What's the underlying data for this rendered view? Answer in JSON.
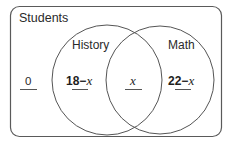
{
  "diagram": {
    "type": "venn",
    "universe_label": "Students",
    "sets": [
      {
        "name": "History",
        "label": "History"
      },
      {
        "name": "Math",
        "label": "Math"
      }
    ],
    "regions": {
      "outside": {
        "value": "0"
      },
      "history_only": {
        "number": "18",
        "op": "−",
        "var": "x"
      },
      "both": {
        "var": "x"
      },
      "math_only": {
        "number": "22",
        "op": "−",
        "var": "x"
      }
    }
  },
  "colors": {
    "stroke": "#555555",
    "text": "#222222",
    "background": "#ffffff"
  }
}
